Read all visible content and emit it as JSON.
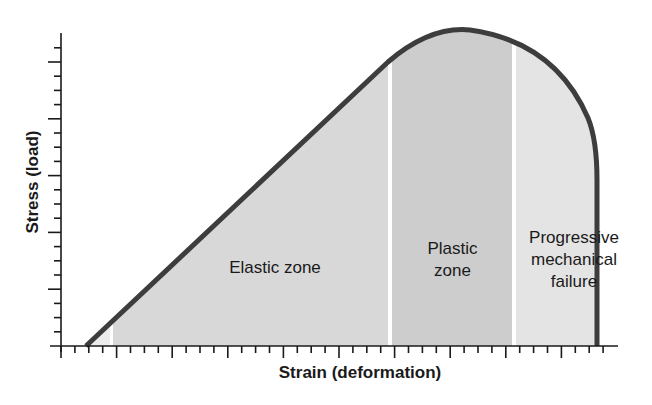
{
  "chart_data": {
    "type": "area",
    "title": "",
    "xlabel": "Strain (deformation)",
    "ylabel": "Stress (load)",
    "grid": false,
    "legend": null,
    "x_ticks": {
      "count": 40,
      "major_every": 4,
      "labels": []
    },
    "y_ticks": {
      "count": 22,
      "major_every": 4,
      "labels": []
    },
    "curve_description": "Stress-strain curve: linear rise from near origin (elastic), rounding to a peak (plastic), then dropping steeply to zero (failure)",
    "curve_points_normalized": [
      {
        "x": 0.05,
        "y": 0.0
      },
      {
        "x": 0.58,
        "y": 0.9
      },
      {
        "x": 0.7,
        "y": 1.0
      },
      {
        "x": 0.82,
        "y": 0.93
      },
      {
        "x": 0.9,
        "y": 0.7
      },
      {
        "x": 0.9,
        "y": 0.0
      }
    ],
    "zones": [
      {
        "name": "Elastic zone",
        "x_start": 0.09,
        "x_end": 0.59,
        "color": "#d8d8d8"
      },
      {
        "name": "Plastic zone",
        "x_start": 0.59,
        "x_end": 0.8,
        "color": "#cdcdcd"
      },
      {
        "name": "Progressive mechanical failure",
        "x_start": 0.8,
        "x_end": 0.95,
        "color": "#e4e4e4"
      }
    ]
  },
  "labels": {
    "ylabel": "Stress (load)",
    "xlabel": "Strain (deformation)",
    "elastic": "Elastic zone",
    "plastic_line1": "Plastic",
    "plastic_line2": "zone",
    "failure_line1": "Progressive",
    "failure_line2": "mechanical",
    "failure_line3": "failure"
  },
  "colors": {
    "curve": "#3d3d3d",
    "axis": "#1a1a1a",
    "elastic_fill": "#d8d8d8",
    "plastic_fill": "#cdcdcd",
    "failure_fill": "#e4e4e4",
    "divider": "#ffffff"
  }
}
